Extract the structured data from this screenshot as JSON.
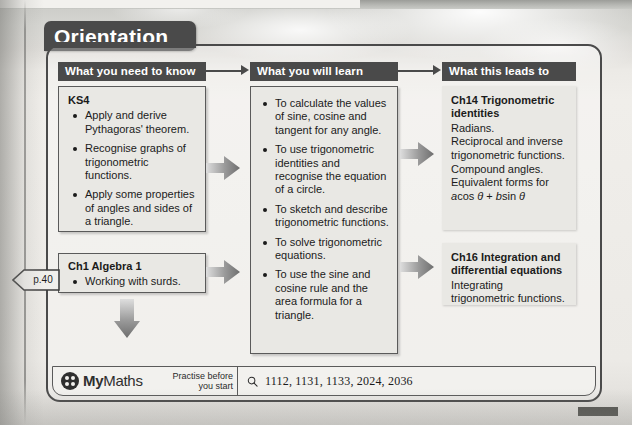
{
  "page": {
    "title": "Orientation",
    "page_ref": "p.40"
  },
  "columns": [
    {
      "id": "need-to-know",
      "header": "What you need to know",
      "boxes": [
        {
          "id": "ks4",
          "title": "KS4",
          "bullets": [
            "Apply and derive Pythagoras' theorem.",
            "Recognise graphs of trigonometric functions.",
            "Apply some properties of angles and sides of a triangle."
          ]
        },
        {
          "id": "ch1",
          "title": "Ch1 Algebra 1",
          "bullets": [
            "Working with surds."
          ]
        }
      ]
    },
    {
      "id": "will-learn",
      "header": "What you will learn",
      "boxes": [
        {
          "id": "learn",
          "title": "",
          "bullets": [
            "To calculate the values of sine, cosine and tangent for any angle.",
            "To use trigonometric identities and recognise the equation of a circle.",
            "To sketch and describe trigonometric functions.",
            "To solve trigonometric equations.",
            "To use the sine and cosine rule and the area formula for a triangle."
          ]
        }
      ]
    },
    {
      "id": "leads-to",
      "header": "What this leads to",
      "boxes": [
        {
          "id": "ch14",
          "title": "Ch14 Trigonometric identities",
          "lines": [
            "Radians.",
            "Reciprocal and inverse trigonometric functions.",
            "Compound angles.",
            "Equivalent forms for"
          ],
          "formula_parts": {
            "a": "a",
            "cos": "cos ",
            "theta1": "θ",
            "plus": " + ",
            "b": "b",
            "sin": "sin ",
            "theta2": "θ"
          }
        },
        {
          "id": "ch16",
          "title": "Ch16 Integration and differential equations",
          "lines": [
            "Integrating trigonometric functions."
          ]
        }
      ]
    }
  ],
  "footer": {
    "brand_my": "My",
    "brand_maths": "Maths",
    "practise_line1": "Practise before",
    "practise_line2": "you start",
    "search_icon": "magnifier-icon",
    "codes": "1112, 1131, 1133, 2024, 2036"
  },
  "colors": {
    "header_chip": "#4a4a4a",
    "box_fill": "#e9e8e4",
    "box_border": "#5a5a5a",
    "arrow_dark": "#6e6e6e",
    "arrow_light": "#d3d3d0",
    "text": "#1b1b1b"
  }
}
